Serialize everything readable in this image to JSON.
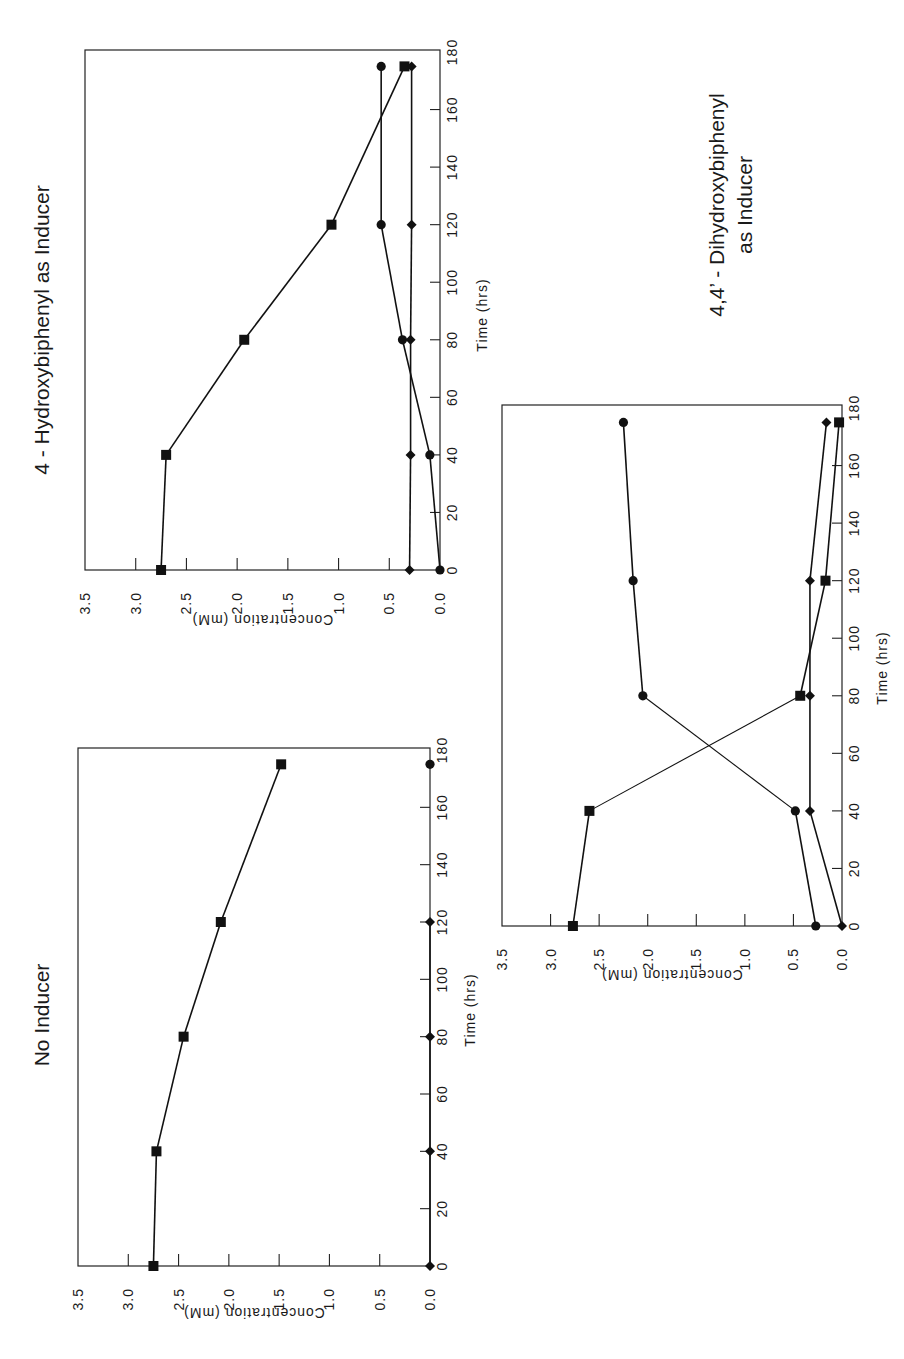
{
  "figure": {
    "panels": [
      {
        "id": "hydroxy",
        "title_lines": [
          "4 - Hydroxybiphenyl as Inducer"
        ]
      },
      {
        "id": "none",
        "title_lines": [
          "No Inducer"
        ]
      },
      {
        "id": "dihydroxy",
        "title_lines": [
          "4,4’ - Dihydroxybiphenyl",
          "as Inducer"
        ]
      }
    ]
  },
  "chart_data": [
    {
      "type": "line",
      "title": "4-Hydroxybiphenyl as Inducer",
      "xlabel": "Time (hrs)",
      "ylabel": "Concentration (mM)",
      "xlim": [
        0,
        180
      ],
      "ylim": [
        0.0,
        3.5
      ],
      "xticks": [
        0,
        20,
        40,
        60,
        80,
        100,
        120,
        140,
        160,
        180
      ],
      "yticks": [
        "0.0",
        "0.5",
        "1.0",
        "1.5",
        "2.0",
        "2.5",
        "3.0",
        "3.5"
      ],
      "grid": false,
      "orientation": "rotated 90° counter-clockwise",
      "series": [
        {
          "name": "square",
          "marker": "square",
          "x": [
            0,
            40,
            80,
            120,
            175
          ],
          "values": [
            2.75,
            2.7,
            1.93,
            1.07,
            0.35
          ]
        },
        {
          "name": "circle",
          "marker": "circle",
          "x": [
            0,
            40,
            80,
            120,
            175
          ],
          "values": [
            0.0,
            0.1,
            0.37,
            0.58,
            0.58
          ]
        },
        {
          "name": "diamond",
          "marker": "diamond",
          "x": [
            0,
            40,
            80,
            120,
            175
          ],
          "values": [
            0.3,
            0.29,
            0.29,
            0.28,
            0.28
          ]
        }
      ]
    },
    {
      "type": "line",
      "title": "No Inducer",
      "xlabel": "Time (hrs)",
      "ylabel": "Concentration (mM)",
      "xlim": [
        0,
        180
      ],
      "ylim": [
        0.0,
        3.5
      ],
      "xticks": [
        0,
        20,
        40,
        60,
        80,
        100,
        120,
        140,
        160,
        180
      ],
      "yticks": [
        "0.0",
        "0.5",
        "1.0",
        "1.5",
        "2.0",
        "2.5",
        "3.0",
        "3.5"
      ],
      "grid": false,
      "orientation": "rotated 90° counter-clockwise",
      "series": [
        {
          "name": "square",
          "marker": "square",
          "x": [
            0,
            40,
            80,
            120,
            175
          ],
          "values": [
            2.75,
            2.72,
            2.45,
            2.08,
            1.48
          ]
        },
        {
          "name": "diamond",
          "marker": "diamond",
          "x": [
            0,
            40,
            80,
            120
          ],
          "values": [
            0.0,
            0.0,
            0.0,
            0.0
          ]
        },
        {
          "name": "circle",
          "marker": "circle",
          "x": [
            175
          ],
          "values": [
            0.0
          ]
        }
      ]
    },
    {
      "type": "line",
      "title": "4,4'-Dihydroxybiphenyl as Inducer",
      "xlabel": "Time (hrs)",
      "ylabel": "Concentration (mM)",
      "xlim": [
        0,
        180
      ],
      "ylim": [
        0.0,
        3.5
      ],
      "xticks": [
        0,
        20,
        40,
        60,
        80,
        100,
        120,
        140,
        160,
        180
      ],
      "yticks": [
        "0.0",
        "0.5",
        "1.0",
        "1.5",
        "2.0",
        "2.5",
        "3.0",
        "3.5"
      ],
      "grid": false,
      "orientation": "rotated 90° counter-clockwise",
      "series": [
        {
          "name": "square",
          "marker": "square",
          "x": [
            0,
            40,
            80,
            120,
            175
          ],
          "values": [
            2.77,
            2.6,
            0.43,
            0.17,
            0.03
          ]
        },
        {
          "name": "circle",
          "marker": "circle",
          "x": [
            0,
            40,
            80,
            120,
            175
          ],
          "values": [
            0.27,
            0.48,
            2.05,
            2.15,
            2.25
          ]
        },
        {
          "name": "diamond",
          "marker": "diamond",
          "x": [
            0,
            40,
            80,
            120,
            175
          ],
          "values": [
            0.0,
            0.33,
            0.33,
            0.33,
            0.16
          ]
        }
      ]
    }
  ],
  "layout": {
    "panels": [
      {
        "left": 85,
        "top": 50,
        "zero_x": 440,
        "zero_y": 570,
        "top_y": 52,
        "title_cx": 42,
        "title_cy": 330,
        "xtitle_cx": 487,
        "xtitle_cy": 315,
        "ytitle_cx": 48,
        "ytitle_cy": 615,
        "thin": []
      },
      {
        "left": 78,
        "top": 748,
        "zero_x": 430,
        "zero_y": 1266,
        "top_y": 750,
        "title_cx": 42,
        "title_cy": 1015,
        "xtitle_cx": 475,
        "xtitle_cy": 1010,
        "ytitle_cx": 40,
        "ytitle_cy": 1308,
        "thin": []
      },
      {
        "left": 502,
        "top": 405,
        "zero_x": 842,
        "zero_y": 926,
        "top_y": 408,
        "title_cx": 728,
        "title_cy": 205,
        "xtitle_cx": 887,
        "xtitle_cy": 668,
        "ytitle_cx": 470,
        "ytitle_cy": 970,
        "thin": [
          "square-40-80",
          "circle-40-80"
        ]
      }
    ]
  }
}
